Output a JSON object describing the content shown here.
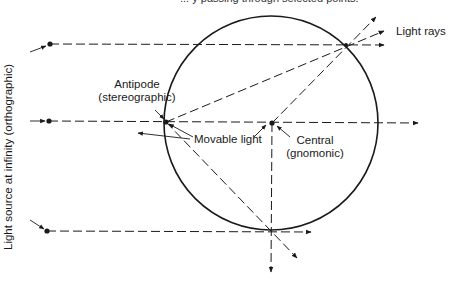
{
  "caption_top": "... y passing through selected points.",
  "labels": {
    "light_rays": "Light rays",
    "antipode_line1": "Antipode",
    "antipode_line2": "(stereographic)",
    "movable_light": "Movable light",
    "central_line1": "Central",
    "central_line2": "(gnomonic)",
    "light_source_infinity": "Light source at infinity (orthographic)"
  },
  "colors": {
    "stroke": "#1a1a1a",
    "background": "#ffffff"
  },
  "geometry": {
    "circle": {
      "cx": 271,
      "cy": 123,
      "r": 107
    },
    "sources": [
      [
        50,
        44
      ],
      [
        49,
        121
      ],
      [
        47,
        231
      ]
    ],
    "antipode": [
      166,
      122
    ],
    "center": [
      272,
      123
    ],
    "top_right_point": [
      346,
      45
    ],
    "bottom_point": [
      271,
      231
    ]
  }
}
